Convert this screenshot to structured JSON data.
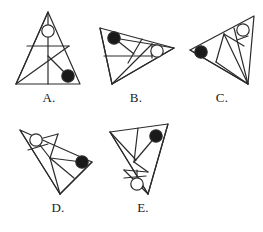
{
  "page": {
    "kind": "geometry-figure-set",
    "background_color": "#ffffff",
    "stroke_color": "#2b2b2b",
    "filled_marker_color": "#1a1a1a",
    "open_marker_fill": "#ffffff",
    "stroke_width": 1.2,
    "marker_radius": 6.2,
    "label_font_size": 13
  },
  "figures": [
    {
      "id": "figure-a",
      "label": "A.",
      "x": 10,
      "y": 6,
      "width": 78,
      "height": 84,
      "label_y": 84,
      "viewbox": "0 0 78 84",
      "description": "upright isosceles triangle with vertical median, horizontal crossbar and internal diagonals",
      "polygon": "38,6 6,78 70,78",
      "lines": [
        {
          "name": "vertical-median",
          "x1": 38,
          "y1": 6,
          "x2": 38,
          "y2": 78
        },
        {
          "name": "horizontal-crossbar",
          "x1": 17,
          "y1": 40,
          "x2": 59,
          "y2": 40
        },
        {
          "name": "apex-to-left-base",
          "x1": 38,
          "y1": 6,
          "x2": 6,
          "y2": 78
        },
        {
          "name": "left-base-to-upper-right",
          "x1": 6,
          "y1": 78,
          "x2": 59,
          "y2": 40
        },
        {
          "name": "center-to-right-marker",
          "x1": 38,
          "y1": 50,
          "x2": 58,
          "y2": 70
        }
      ],
      "markers": [
        {
          "name": "open-circle-top",
          "cx": 38,
          "cy": 25,
          "fill": "open"
        },
        {
          "name": "filled-circle-bottom-right",
          "cx": 58,
          "cy": 70,
          "fill": "filled"
        }
      ]
    },
    {
      "id": "figure-b",
      "label": "B.",
      "x": 94,
      "y": 6,
      "width": 84,
      "height": 84,
      "label_y": 84,
      "viewbox": "0 0 84 84",
      "description": "right-pointing scalene triangle with crossing internal chords",
      "polygon": "6,22 80,42 18,78",
      "lines": [
        {
          "name": "top-edge-to-lower-vertex",
          "x1": 6,
          "y1": 22,
          "x2": 18,
          "y2": 78
        },
        {
          "name": "marker-to-right-vertex",
          "x1": 20,
          "y1": 32,
          "x2": 80,
          "y2": 42
        },
        {
          "name": "marker-to-mid-chord",
          "x1": 20,
          "y1": 32,
          "x2": 40,
          "y2": 48
        },
        {
          "name": "left-horizontal-chord",
          "x1": 10,
          "y1": 50,
          "x2": 58,
          "y2": 50
        },
        {
          "name": "crossing-chord-upper",
          "x1": 48,
          "y1": 33,
          "x2": 34,
          "y2": 57
        },
        {
          "name": "crossing-chord-lower",
          "x1": 18,
          "y1": 78,
          "x2": 58,
          "y2": 38
        },
        {
          "name": "vertical-short-chord",
          "x1": 58,
          "y1": 38,
          "x2": 58,
          "y2": 52
        },
        {
          "name": "base-to-right-vertex",
          "x1": 18,
          "y1": 78,
          "x2": 80,
          "y2": 42
        }
      ],
      "markers": [
        {
          "name": "filled-circle-upper-left",
          "cx": 20,
          "cy": 32,
          "fill": "filled"
        },
        {
          "name": "open-circle-right",
          "cx": 63,
          "cy": 45,
          "fill": "open"
        }
      ]
    },
    {
      "id": "figure-c",
      "label": "C.",
      "x": 182,
      "y": 6,
      "width": 80,
      "height": 84,
      "label_y": 84,
      "viewbox": "0 0 80 84",
      "description": "left-pointing triangle with fan of chords from bottom vertex",
      "polygon": "8,44 72,10 66,78",
      "lines": [
        {
          "name": "upper-edge-to-bottom-vertex",
          "x1": 8,
          "y1": 44,
          "x2": 66,
          "y2": 78
        },
        {
          "name": "chord-upper-to-bottom",
          "x1": 42,
          "y1": 28,
          "x2": 66,
          "y2": 78
        },
        {
          "name": "chord-mid-to-bottom",
          "x1": 34,
          "y1": 56,
          "x2": 66,
          "y2": 78
        },
        {
          "name": "chord-cross-left",
          "x1": 42,
          "y1": 28,
          "x2": 34,
          "y2": 56
        },
        {
          "name": "chord-to-open-marker",
          "x1": 42,
          "y1": 28,
          "x2": 62,
          "y2": 40
        },
        {
          "name": "chord-marker-diagonal",
          "x1": 52,
          "y1": 22,
          "x2": 66,
          "y2": 78
        },
        {
          "name": "short-chord-under-marker",
          "x1": 55,
          "y1": 34,
          "x2": 66,
          "y2": 30
        }
      ],
      "markers": [
        {
          "name": "filled-circle-left-vertex",
          "cx": 19,
          "cy": 46,
          "fill": "filled"
        },
        {
          "name": "open-circle-upper-right",
          "cx": 61,
          "cy": 24,
          "fill": "open"
        }
      ]
    },
    {
      "id": "figure-d",
      "label": "D.",
      "x": 14,
      "y": 114,
      "width": 88,
      "height": 86,
      "label_y": 86,
      "viewbox": "0 0 88 86",
      "description": "right-pointing triangle with apex at lower left and fan of internal chords",
      "polygon": "6,16 78,48 46,80",
      "lines": [
        {
          "name": "left-edge-to-bottom-vertex",
          "x1": 6,
          "y1": 16,
          "x2": 46,
          "y2": 80
        },
        {
          "name": "open-marker-to-upper-chord",
          "x1": 22,
          "y1": 26,
          "x2": 44,
          "y2": 20
        },
        {
          "name": "upper-chord-to-center",
          "x1": 44,
          "y1": 20,
          "x2": 36,
          "y2": 44
        },
        {
          "name": "center-to-filled-marker",
          "x1": 36,
          "y1": 44,
          "x2": 68,
          "y2": 48
        },
        {
          "name": "open-marker-to-center",
          "x1": 22,
          "y1": 26,
          "x2": 36,
          "y2": 44
        },
        {
          "name": "short-chord-left",
          "x1": 14,
          "y1": 36,
          "x2": 34,
          "y2": 30
        },
        {
          "name": "center-to-bottom-vertex",
          "x1": 36,
          "y1": 44,
          "x2": 46,
          "y2": 80
        },
        {
          "name": "chord-mid-right",
          "x1": 36,
          "y1": 44,
          "x2": 60,
          "y2": 64
        },
        {
          "name": "bottom-edge-to-right-vertex",
          "x1": 46,
          "y1": 80,
          "x2": 78,
          "y2": 48
        }
      ],
      "markers": [
        {
          "name": "open-circle-upper-left",
          "cx": 22,
          "cy": 26,
          "fill": "open"
        },
        {
          "name": "filled-circle-right-vertex",
          "cx": 68,
          "cy": 48,
          "fill": "filled"
        }
      ]
    },
    {
      "id": "figure-e",
      "label": "E.",
      "x": 104,
      "y": 114,
      "width": 78,
      "height": 86,
      "label_y": 86,
      "viewbox": "0 0 78 86",
      "description": "downward elongated triangle with zigzag internal chords",
      "polygon": "6,18 64,10 44,80",
      "lines": [
        {
          "name": "left-vertex-to-bottom",
          "x1": 6,
          "y1": 18,
          "x2": 44,
          "y2": 80
        },
        {
          "name": "top-edge-vertical-chord",
          "x1": 34,
          "y1": 14,
          "x2": 30,
          "y2": 48
        },
        {
          "name": "left-vertex-to-center",
          "x1": 6,
          "y1": 18,
          "x2": 32,
          "y2": 46
        },
        {
          "name": "filled-marker-to-center",
          "x1": 52,
          "y1": 22,
          "x2": 30,
          "y2": 48
        },
        {
          "name": "zigzag-upper",
          "x1": 30,
          "y1": 48,
          "x2": 44,
          "y2": 58
        },
        {
          "name": "zigzag-lower",
          "x1": 44,
          "y1": 58,
          "x2": 20,
          "y2": 56
        },
        {
          "name": "zigzag-return",
          "x1": 20,
          "y1": 56,
          "x2": 44,
          "y2": 80
        },
        {
          "name": "horizontal-chord-lower",
          "x1": 20,
          "y1": 64,
          "x2": 42,
          "y2": 62
        },
        {
          "name": "open-marker-stem",
          "x1": 33,
          "y1": 56,
          "x2": 33,
          "y2": 64
        },
        {
          "name": "right-edge-to-bottom",
          "x1": 64,
          "y1": 10,
          "x2": 44,
          "y2": 80
        }
      ],
      "markers": [
        {
          "name": "filled-circle-top-right",
          "cx": 52,
          "cy": 22,
          "fill": "filled"
        },
        {
          "name": "open-circle-lower-mid",
          "cx": 33,
          "cy": 70,
          "fill": "open"
        }
      ]
    }
  ]
}
